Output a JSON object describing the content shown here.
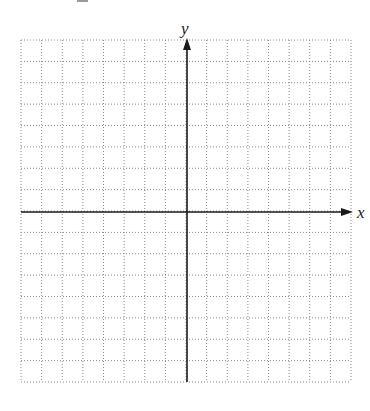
{
  "diagram": {
    "type": "coordinate-plane",
    "grid": {
      "columns": 16,
      "rows": 16,
      "left": 21,
      "top": 40,
      "right": 351,
      "bottom": 382,
      "line_style": "dotted",
      "line_color": "#8a8a8a"
    },
    "axes": {
      "color": "#1a1a1a",
      "origin_px": {
        "x": 187,
        "y": 212
      },
      "x_label": "x",
      "y_label": "y"
    }
  }
}
